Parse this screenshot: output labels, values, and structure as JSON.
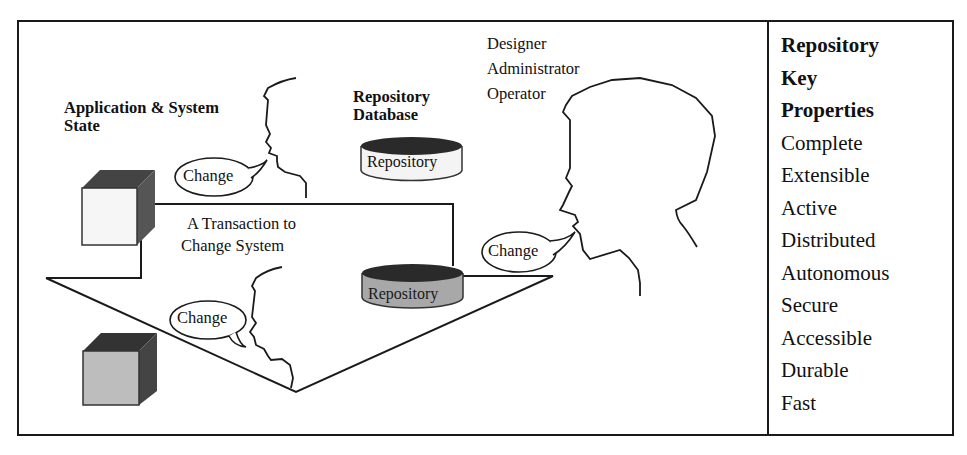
{
  "figure": {
    "app_state_label": [
      "Application & System",
      "State"
    ],
    "repo_db_label": [
      "Repository",
      "Database"
    ],
    "roles": [
      "Designer",
      "Administrator",
      "Operator"
    ],
    "transaction_label": [
      "A Transaction to",
      "Change System"
    ],
    "cylinder_top_label": "Repository",
    "cylinder_bottom_label": "Repository",
    "speech_bubbles": [
      "Change",
      "Change",
      "Change"
    ]
  },
  "properties_panel": {
    "heading": [
      "Repository",
      "Key",
      "Properties"
    ],
    "items": [
      "Complete",
      "Extensible",
      "Active",
      "Distributed",
      "Autonomous",
      "Secure",
      "Accessible",
      "Durable",
      "Fast"
    ]
  }
}
